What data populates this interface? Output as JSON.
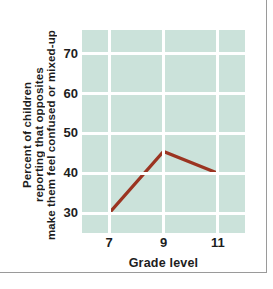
{
  "chart_data": {
    "type": "line",
    "title": "",
    "subtitle": "",
    "xlabel": "Grade level",
    "ylabel": "Percent of children reporting that opposites make them feel confused or mixed-up",
    "ylabel_lines": [
      "Percent of children",
      "reporting that opposites",
      "make them feel confused or mixed-up"
    ],
    "x": [
      7,
      9,
      11
    ],
    "categories": [
      "7",
      "9",
      "11"
    ],
    "values": [
      30,
      45.5,
      40
    ],
    "series": [
      {
        "name": "Percent confused by opposites",
        "values": [
          30,
          45.5,
          40
        ]
      }
    ],
    "xtick_labels": [
      "7",
      "9",
      "11"
    ],
    "ytick_labels": [
      "30",
      "40",
      "50",
      "60",
      "70"
    ],
    "yticks": [
      30,
      40,
      50,
      60,
      70
    ],
    "xlim": [
      6,
      12
    ],
    "ylim": [
      25,
      76
    ],
    "grid": true,
    "legend": "none",
    "annotations": [],
    "colors": {
      "line": "#9b3421",
      "plot_background": "#cbe2da",
      "gridline": "#ffffff",
      "text": "#1d1d1d",
      "frame": "#9a9a9a",
      "page_background": "#ffffff"
    }
  }
}
